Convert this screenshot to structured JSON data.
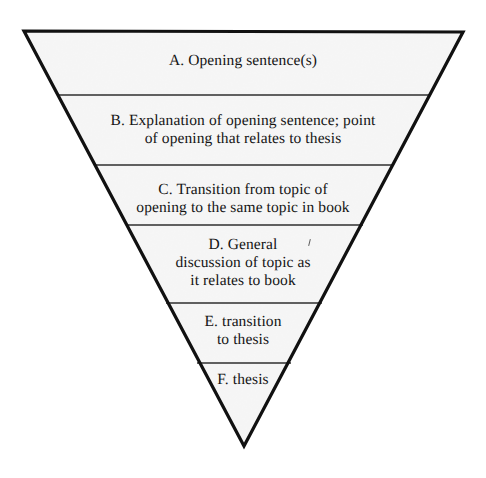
{
  "diagram": {
    "name": "inverted-triangle-introduction-funnel",
    "shape": "inverted-triangle",
    "colors": {
      "outline": "#111111",
      "fill": "#ececec",
      "divider": "#2b2b2b",
      "text": "#141414",
      "background": "#ffffff"
    },
    "geometry": {
      "top_left": [
        24,
        31
      ],
      "top_right": [
        463,
        32
      ],
      "apex": [
        244,
        446
      ],
      "divider_y": [
        95,
        165,
        225,
        303,
        363
      ]
    },
    "bands": [
      {
        "id": "a",
        "letter": "A",
        "text": "A. Opening sentence(s)",
        "lines": [
          "A. Opening sentence(s)"
        ]
      },
      {
        "id": "b",
        "letter": "B",
        "text": "B. Explanation of opening sentence; point\nof opening that relates to thesis",
        "lines": [
          "B. Explanation of opening sentence; point",
          "of opening that relates to thesis"
        ]
      },
      {
        "id": "c",
        "letter": "C",
        "text": "C. Transition from topic of\nopening to the same topic in book",
        "lines": [
          "C. Transition from topic of",
          "opening to the same topic in book"
        ]
      },
      {
        "id": "d",
        "letter": "D",
        "text": "D. General\ndiscussion of topic as\nit relates to book",
        "lines": [
          "D. General",
          "discussion of topic as",
          "it relates to book"
        ]
      },
      {
        "id": "e",
        "letter": "E",
        "text": "E. transition\nto thesis",
        "lines": [
          "E. transition",
          "to thesis"
        ]
      },
      {
        "id": "f",
        "letter": "F",
        "text": "F. thesis",
        "lines": [
          "F. thesis"
        ]
      }
    ]
  }
}
